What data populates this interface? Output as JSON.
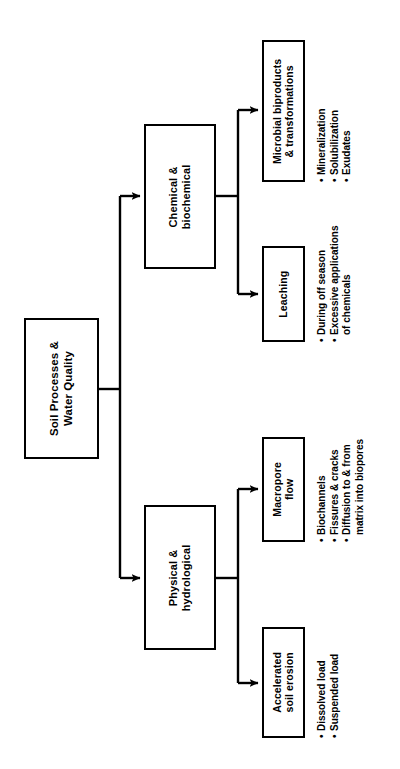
{
  "diagram": {
    "orientation": "rotated-90-ccw",
    "line_color": "#000000",
    "background_color": "#ffffff",
    "root": {
      "label": "Soil Processes &\nWater Quality"
    },
    "branches": [
      {
        "label": "Chemical &\nbiochemical",
        "children": [
          {
            "label": "Microbial biproducts\n& transformations",
            "bullets": [
              "Mineralization",
              "Solubilization",
              "Exudates"
            ]
          },
          {
            "label": "Leaching",
            "bullets": [
              "During off season",
              "Excessive applications",
              "of chemicals"
            ]
          }
        ]
      },
      {
        "label": "Physical &\nhydrological",
        "children": [
          {
            "label": "Macropore\nflow",
            "bullets": [
              "Biochannels",
              "Fissures & cracks",
              "Diffusion to & from",
              "matrix into biopores"
            ]
          },
          {
            "label": "Accelerated\nsoil erosion",
            "bullets": [
              "Dissolved load",
              "Suspended load"
            ]
          }
        ]
      }
    ],
    "bullet_marker": "•"
  }
}
